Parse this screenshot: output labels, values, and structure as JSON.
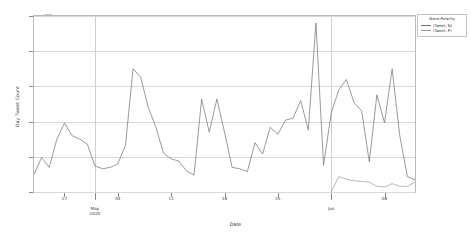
{
  "chart_data": {
    "type": "line",
    "title": "",
    "xlabel": "Date",
    "ylabel": "Day Tweet Count",
    "ylim": [
      0,
      250
    ],
    "yticks": [
      0,
      50,
      100,
      150,
      200,
      250
    ],
    "grid": true,
    "legend_position": "top-right",
    "legend_title": "None,Polarity",
    "x_start_date": "2020-04-23",
    "x_end_date": "2020-06-12",
    "xticks": [
      {
        "label": "27",
        "date": "2020-04-27"
      },
      {
        "label": "04",
        "date": "2020-05-04"
      },
      {
        "label": "11",
        "date": "2020-05-11"
      },
      {
        "label": "18",
        "date": "2020-05-18"
      },
      {
        "label": "25",
        "date": "2020-05-25"
      },
      {
        "label": "08",
        "date": "2020-06-08"
      }
    ],
    "month_markers": [
      {
        "label": "May\n2020",
        "line1": "May",
        "line2": "2020",
        "date": "2020-05-01"
      },
      {
        "label": "Jun",
        "line1": "Jun",
        "line2": "",
        "date": "2020-06-01"
      }
    ],
    "series": [
      {
        "name": "(Tweet, N)",
        "color": "#6f6f6f",
        "start_date": "2020-04-23",
        "values": [
          25,
          49,
          35,
          75,
          98,
          80,
          75,
          68,
          37,
          33,
          35,
          40,
          66,
          175,
          163,
          120,
          92,
          55,
          47,
          44,
          30,
          24,
          132,
          85,
          132,
          85,
          35,
          33,
          29,
          70,
          54,
          92,
          82,
          102,
          105,
          130,
          88,
          240,
          38,
          112,
          145,
          160,
          127,
          115,
          43,
          138,
          98,
          175,
          80,
          22,
          17,
          62,
          48,
          110,
          5
        ]
      },
      {
        "name": "(Tweet, P)",
        "color": "#9a9a9a",
        "start_date": "2020-06-01",
        "values": [
          0,
          22,
          18,
          16,
          15,
          14,
          8,
          7,
          12,
          8,
          8,
          14,
          12,
          0
        ]
      }
    ]
  },
  "axes": {
    "y_title": "Day Tweet Count",
    "x_title": "Date"
  }
}
